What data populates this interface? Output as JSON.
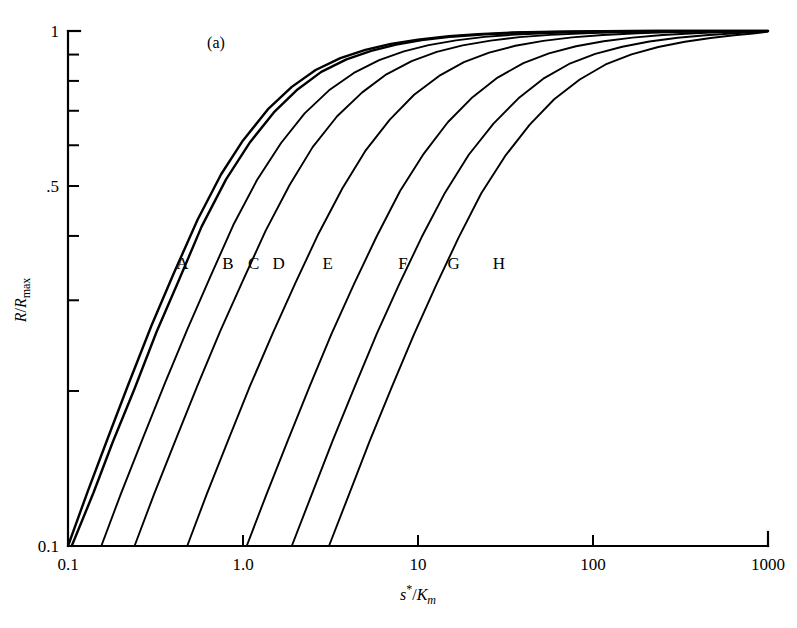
{
  "figure": {
    "panel_label": "(a)",
    "background_color": "#ffffff",
    "line_color": "#000000"
  },
  "chart_data": {
    "type": "line",
    "title": "",
    "subtitle": "",
    "panel": "(a)",
    "xlabel": "s*/Km",
    "xlabel_parts": {
      "italic_s": "s",
      "star": "*",
      "slash": "/",
      "italic_K": "K",
      "sub_m": "m"
    },
    "ylabel": "R/Rmax",
    "ylabel_parts": {
      "italic_R": "R",
      "slash": "/",
      "italic_R2": "R",
      "sub_max": "max"
    },
    "xscale": "log",
    "yscale": "log",
    "xlim": [
      0.1,
      1000
    ],
    "ylim": [
      0.1,
      1.0
    ],
    "grid": false,
    "legend": "inline-curve-labels",
    "xticks": [
      0.1,
      1.0,
      10,
      100,
      1000
    ],
    "xtick_labels": [
      "0.1",
      "1.0",
      "10",
      "100",
      "1000"
    ],
    "yticks": [
      0.1,
      0.2,
      0.3,
      0.4,
      0.5,
      0.6,
      0.7,
      0.8,
      0.9,
      1.0
    ],
    "ytick_labels": [
      "0.1",
      "",
      "",
      "",
      ".5",
      "",
      "",
      "",
      "",
      "1"
    ],
    "ytick_labeled": [
      {
        "value": 1.0,
        "label": "1"
      },
      {
        "value": 0.5,
        "label": ".5"
      },
      {
        "value": 0.1,
        "label": "0.1"
      }
    ],
    "curve_labels": [
      "A",
      "B",
      "C",
      "D",
      "E",
      "F",
      "G",
      "H"
    ],
    "series": [
      {
        "name": "A",
        "label": "A",
        "label_x": 0.45,
        "label_y": 0.355,
        "x": [
          0.1,
          0.13,
          0.17,
          0.22,
          0.3,
          0.4,
          0.55,
          0.75,
          1.0,
          1.4,
          1.9,
          2.6,
          3.6,
          5.0,
          7.0,
          10.0,
          15.0,
          22.0,
          35.0,
          60.0,
          110.0,
          220.0,
          500.0,
          1000.0
        ],
        "y": [
          0.1,
          0.128,
          0.163,
          0.205,
          0.268,
          0.337,
          0.43,
          0.527,
          0.613,
          0.707,
          0.779,
          0.84,
          0.886,
          0.919,
          0.944,
          0.962,
          0.977,
          0.986,
          0.993,
          0.997,
          0.999,
          1.0,
          1.0,
          1.0
        ]
      },
      {
        "name": "B",
        "label": "B",
        "label_x": 0.82,
        "label_y": 0.355,
        "x": [
          0.105,
          0.14,
          0.18,
          0.24,
          0.32,
          0.43,
          0.58,
          0.8,
          1.1,
          1.5,
          2.05,
          2.8,
          3.9,
          5.4,
          7.5,
          10.5,
          16.0,
          24.0,
          38.0,
          65.0,
          120.0,
          240.0,
          520.0,
          1000.0
        ],
        "y": [
          0.1,
          0.127,
          0.159,
          0.202,
          0.26,
          0.328,
          0.417,
          0.515,
          0.609,
          0.695,
          0.77,
          0.833,
          0.881,
          0.915,
          0.941,
          0.96,
          0.976,
          0.985,
          0.992,
          0.996,
          0.999,
          1.0,
          1.0,
          1.0
        ]
      },
      {
        "name": "C",
        "label": "C",
        "label_x": 1.15,
        "label_y": 0.355,
        "x": [
          0.155,
          0.2,
          0.27,
          0.36,
          0.48,
          0.65,
          0.88,
          1.2,
          1.65,
          2.25,
          3.1,
          4.3,
          6.0,
          8.3,
          11.5,
          16.5,
          24.0,
          36.0,
          58.0,
          100.0,
          180.0,
          330.0,
          620.0,
          1000.0
        ],
        "y": [
          0.1,
          0.126,
          0.163,
          0.208,
          0.263,
          0.333,
          0.42,
          0.513,
          0.606,
          0.692,
          0.767,
          0.829,
          0.878,
          0.913,
          0.939,
          0.959,
          0.974,
          0.984,
          0.991,
          0.996,
          0.998,
          1.0,
          1.0,
          1.0
        ]
      },
      {
        "name": "D",
        "label": "D",
        "label_x": 1.6,
        "label_y": 0.355,
        "x": [
          0.24,
          0.31,
          0.41,
          0.55,
          0.74,
          1.0,
          1.35,
          1.85,
          2.5,
          3.45,
          4.8,
          6.6,
          9.2,
          12.8,
          18.0,
          26.0,
          38.0,
          57.0,
          90.0,
          150.0,
          260.0,
          450.0,
          750.0,
          1000.0
        ],
        "y": [
          0.1,
          0.126,
          0.16,
          0.205,
          0.261,
          0.328,
          0.41,
          0.503,
          0.595,
          0.683,
          0.76,
          0.824,
          0.874,
          0.911,
          0.938,
          0.958,
          0.973,
          0.983,
          0.99,
          0.995,
          0.998,
          0.999,
          1.0,
          1.0
        ]
      },
      {
        "name": "E",
        "label": "E",
        "label_x": 3.05,
        "label_y": 0.355,
        "x": [
          0.48,
          0.62,
          0.82,
          1.1,
          1.48,
          2.0,
          2.7,
          3.7,
          5.0,
          6.9,
          9.5,
          13.2,
          18.3,
          25.5,
          36.0,
          52.0,
          76.0,
          114.0,
          180.0,
          290.0,
          470.0,
          700.0,
          900.0,
          1000.0
        ],
        "y": [
          0.1,
          0.126,
          0.16,
          0.205,
          0.259,
          0.325,
          0.404,
          0.495,
          0.585,
          0.673,
          0.752,
          0.818,
          0.87,
          0.908,
          0.936,
          0.957,
          0.972,
          0.982,
          0.99,
          0.995,
          0.998,
          0.999,
          1.0,
          1.0
        ]
      },
      {
        "name": "F",
        "label": "F",
        "label_x": 8.2,
        "label_y": 0.355,
        "x": [
          1.05,
          1.35,
          1.8,
          2.4,
          3.2,
          4.3,
          5.8,
          7.9,
          10.8,
          14.8,
          20.5,
          28.5,
          40.0,
          56.0,
          80.0,
          115.0,
          168.0,
          250.0,
          380.0,
          560.0,
          780.0,
          920.0,
          980.0,
          1000.0
        ],
        "y": [
          0.1,
          0.125,
          0.16,
          0.204,
          0.258,
          0.322,
          0.399,
          0.489,
          0.578,
          0.665,
          0.744,
          0.812,
          0.866,
          0.905,
          0.934,
          0.955,
          0.971,
          0.982,
          0.99,
          0.995,
          0.998,
          0.999,
          1.0,
          1.0
        ]
      },
      {
        "name": "G",
        "label": "G",
        "label_x": 16.0,
        "label_y": 0.355,
        "x": [
          1.9,
          2.45,
          3.25,
          4.35,
          5.8,
          7.8,
          10.5,
          14.3,
          19.5,
          27.0,
          37.5,
          52.0,
          73.0,
          103.0,
          147.0,
          210.0,
          305.0,
          440.0,
          620.0,
          820.0,
          940.0,
          990.0,
          1000.0,
          1000.0
        ],
        "y": [
          0.1,
          0.125,
          0.16,
          0.204,
          0.258,
          0.322,
          0.398,
          0.486,
          0.575,
          0.661,
          0.74,
          0.808,
          0.863,
          0.903,
          0.932,
          0.954,
          0.97,
          0.981,
          0.989,
          0.995,
          0.998,
          0.999,
          1.0,
          1.0
        ]
      },
      {
        "name": "H",
        "label": "H",
        "label_x": 29.0,
        "label_y": 0.355,
        "x": [
          3.1,
          4.0,
          5.3,
          7.1,
          9.5,
          12.7,
          17.0,
          23.0,
          31.5,
          43.5,
          60.0,
          84.0,
          118.0,
          166.0,
          236.0,
          335.0,
          470.0,
          640.0,
          820.0,
          940.0,
          990.0,
          1000.0,
          1000.0,
          1000.0
        ],
        "y": [
          0.1,
          0.125,
          0.16,
          0.204,
          0.258,
          0.321,
          0.396,
          0.484,
          0.572,
          0.658,
          0.737,
          0.805,
          0.861,
          0.901,
          0.931,
          0.953,
          0.969,
          0.981,
          0.989,
          0.994,
          0.997,
          0.999,
          1.0,
          1.0
        ]
      }
    ],
    "annotations": [
      {
        "text": "(a)",
        "x_px": 216,
        "y_px": 42
      }
    ],
    "axis_geometry_px": {
      "left": 68,
      "right": 768,
      "top": 31,
      "bottom": 546,
      "decade_width_px": 175
    }
  }
}
